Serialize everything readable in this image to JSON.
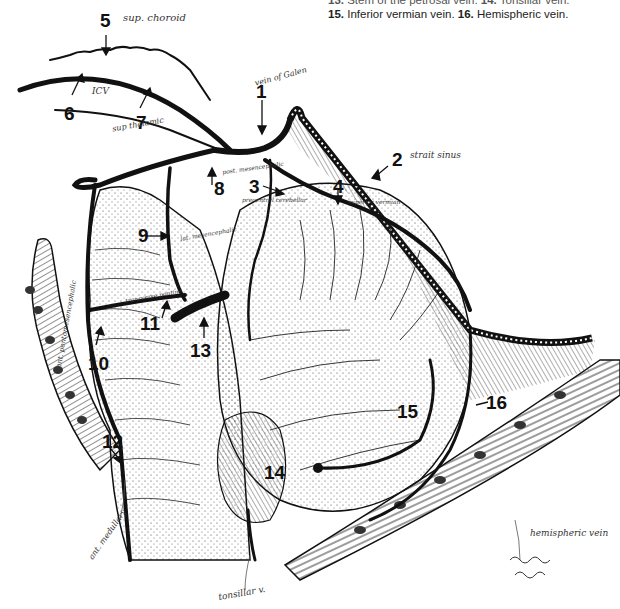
{
  "caption": {
    "line1_prefix": "13.",
    "line1_text": "Stem of the petrosal vein.",
    "line1_suffix": "14. Tonsillar vein.",
    "line2_num_a": "15.",
    "line2_text_a": "Inferior vermian vein.",
    "line2_num_b": "16.",
    "line2_text_b": "Hemispheric vein."
  },
  "labels": [
    {
      "id": "1",
      "number": "1",
      "handwritten": "vein of Galen"
    },
    {
      "id": "2",
      "number": "2",
      "handwritten": "strait sinus"
    },
    {
      "id": "3",
      "number": "3",
      "handwritten": "precentral cerebellar"
    },
    {
      "id": "4",
      "number": "4",
      "handwritten": "superior vermian"
    },
    {
      "id": "5",
      "number": "5",
      "handwritten": "sup. choroid"
    },
    {
      "id": "6",
      "number": "6",
      "handwritten": "ICV"
    },
    {
      "id": "7",
      "number": "7",
      "handwritten": "sup thalamic"
    },
    {
      "id": "8",
      "number": "8",
      "handwritten": "post. mesencephalic"
    },
    {
      "id": "9",
      "number": "9",
      "handwritten": "lat. mesencephalic"
    },
    {
      "id": "10",
      "number": "10",
      "handwritten": "ant. pontomesencephalic"
    },
    {
      "id": "11",
      "number": "11",
      "handwritten": "transverse pontine"
    },
    {
      "id": "12",
      "number": "12",
      "handwritten": "ant. medullary"
    },
    {
      "id": "13",
      "number": "13",
      "handwritten": ""
    },
    {
      "id": "14",
      "number": "14",
      "handwritten": ""
    },
    {
      "id": "15",
      "number": "15",
      "handwritten": ""
    },
    {
      "id": "16",
      "number": "16",
      "handwritten": ""
    }
  ],
  "extra_notes": {
    "tonsillar": "tonsillar v.",
    "hemispheric": "hemispheric vein"
  },
  "colors": {
    "ink": "#111111",
    "paper": "#ffffff",
    "pencil": "#333333"
  }
}
